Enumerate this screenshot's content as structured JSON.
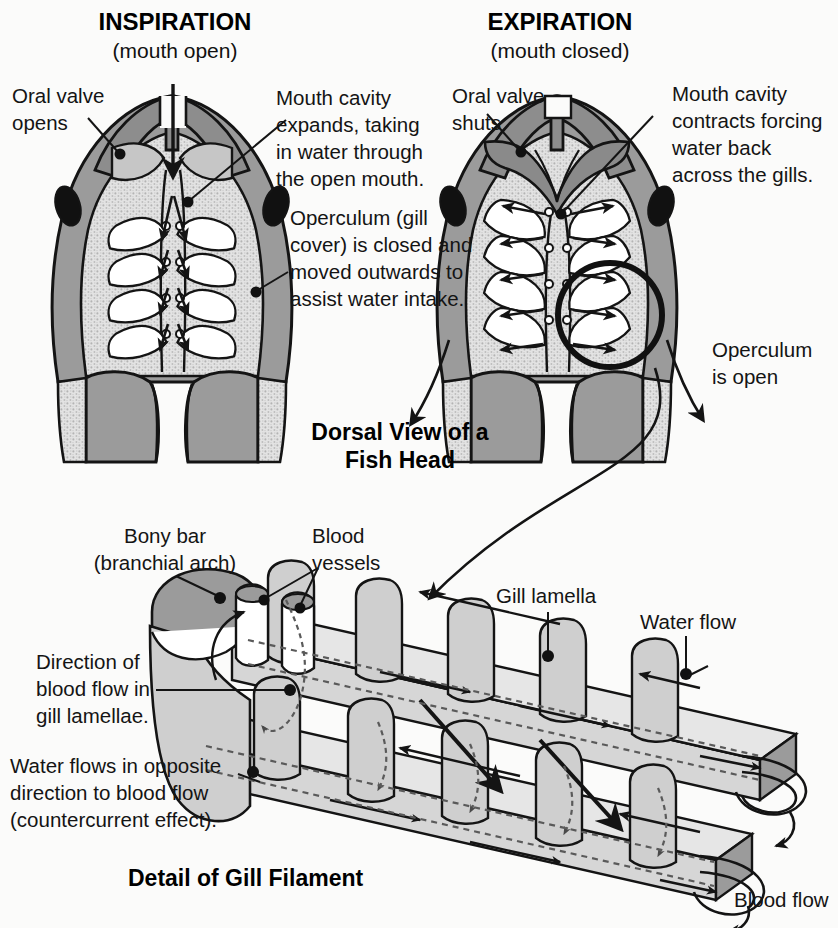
{
  "figure": {
    "panels": {
      "inspiration": {
        "title": "INSPIRATION",
        "subtitle": "(mouth open)",
        "labels": {
          "oral_valve": "Oral valve\nopens",
          "mouth_cavity": "Mouth cavity\nexpands, taking\nin water through\nthe open mouth.",
          "operculum": "Operculum (gill\ncover) is closed and\nmoved outwards to\nassist water intake."
        }
      },
      "expiration": {
        "title": "EXPIRATION",
        "subtitle": "(mouth closed)",
        "labels": {
          "oral_valve": "Oral valve\nshuts",
          "mouth_cavity": "Mouth cavity\ncontracts forcing\nwater back\nacross the gills.",
          "operculum": "Operculum\nis open"
        }
      }
    },
    "section_headings": {
      "dorsal_view": "Dorsal View of\na Fish Head",
      "gill_filament": "Detail of Gill Filament"
    },
    "gill_detail_labels": {
      "bony_bar": "Bony bar\n(branchial arch)",
      "blood_vessels": "Blood\nvessels",
      "gill_lamella": "Gill lamella",
      "water_flow": "Water flow",
      "blood_flow": "Blood flow",
      "direction_blood": "Direction of\nblood flow in\ngill lamellae.",
      "countercurrent": "Water flows in opposite\ndirection to blood flow\n(countercurrent effect)."
    },
    "colors": {
      "background": "#fbfbfa",
      "ink": "#141414",
      "mid_gray": "#9b9b9b",
      "dark_gray": "#7e7e7e",
      "light_gray": "#d9d9d9",
      "cavity_stipple": "#d2d2d2",
      "lamella_fill": "#cfcfcf",
      "white": "#ffffff"
    }
  }
}
